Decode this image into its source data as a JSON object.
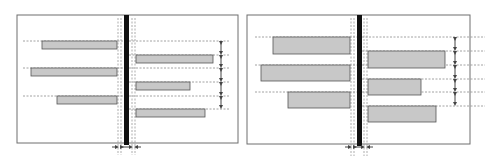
{
  "figure": {
    "colors": {
      "frame": "#6e6e6e",
      "bar_fill": "#c8c8c8",
      "bar_stroke": "#555555",
      "center_bar": "#111111",
      "dashed": "#8a8a8a",
      "arrow": "#444444"
    },
    "panels": [
      {
        "name": "left-panel",
        "frame": {
          "x": 17,
          "y": 15,
          "w": 221,
          "h": 128
        },
        "center_bar": {
          "x": 124,
          "w": 5
        },
        "guide_verticals": [
          118,
          121,
          132,
          135
        ],
        "left_bars": [
          {
            "x1": 42,
            "x2": 117,
            "y": 41,
            "h": 8
          },
          {
            "x1": 31,
            "x2": 117,
            "y": 68,
            "h": 8
          },
          {
            "x1": 57,
            "x2": 117,
            "y": 96,
            "h": 8
          }
        ],
        "right_bars": [
          {
            "x1": 136,
            "x2": 213,
            "y": 55,
            "h": 8
          },
          {
            "x1": 136,
            "x2": 190,
            "y": 82,
            "h": 8
          },
          {
            "x1": 136,
            "x2": 205,
            "y": 109,
            "h": 8
          }
        ],
        "left_dash_ys": [
          41,
          68,
          96
        ],
        "left_dash_x1": 23,
        "right_dash_ys": [
          41,
          55,
          68,
          82,
          96,
          109
        ],
        "right_dash_x2": 230,
        "spacing_arrow_x": 221,
        "bottom_arrows_y": 147
      },
      {
        "name": "right-panel",
        "frame": {
          "x": 247,
          "y": 15,
          "w": 223,
          "h": 129
        },
        "center_bar": {
          "x": 357,
          "w": 5
        },
        "guide_verticals": [
          351,
          354,
          364,
          367
        ],
        "left_bars": [
          {
            "x1": 273,
            "x2": 350,
            "y": 37,
            "h": 17
          },
          {
            "x1": 261,
            "x2": 350,
            "y": 65,
            "h": 16
          },
          {
            "x1": 288,
            "x2": 350,
            "y": 92,
            "h": 16
          }
        ],
        "right_bars": [
          {
            "x1": 368,
            "x2": 445,
            "y": 51,
            "h": 17
          },
          {
            "x1": 368,
            "x2": 421,
            "y": 79,
            "h": 16
          },
          {
            "x1": 368,
            "x2": 436,
            "y": 106,
            "h": 16
          }
        ],
        "left_dash_ys": [
          37,
          65,
          92
        ],
        "left_dash_x1": 255,
        "right_dash_ys": [
          37,
          51,
          65,
          79,
          92,
          106
        ],
        "right_dash_x2": 485,
        "spacing_arrow_x": 455,
        "bottom_arrows_y": 147
      }
    ]
  }
}
